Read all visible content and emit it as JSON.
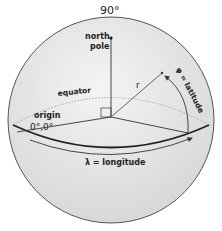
{
  "diagram": {
    "labels": {
      "top_angle": "90°",
      "north_pole_line1": "north",
      "north_pole_line2": "pole",
      "equator": "equator",
      "radius": "r",
      "latitude": "φ = latitude",
      "origin": "origin",
      "origin_coords": "0°,0°",
      "longitude": "λ = longitude"
    },
    "colors": {
      "sphere_fill": "#e6e6e6",
      "sphere_edge": "#555555",
      "lines": "#333333",
      "equator_dotted": "#999999"
    }
  }
}
